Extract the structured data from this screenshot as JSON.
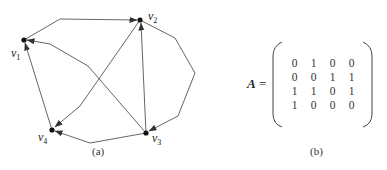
{
  "figure_a": {
    "caption": "(a)",
    "vertices": [
      {
        "id": "v1",
        "label": "v",
        "sub": "1",
        "x": 24,
        "y": 40
      },
      {
        "id": "v2",
        "label": "v",
        "sub": "2",
        "x": 140,
        "y": 20
      },
      {
        "id": "v3",
        "label": "v",
        "sub": "3",
        "x": 146,
        "y": 133
      },
      {
        "id": "v4",
        "label": "v",
        "sub": "4",
        "x": 52,
        "y": 130
      }
    ],
    "edges": [
      {
        "from": "v1",
        "to": "v2"
      },
      {
        "from": "v2",
        "to": "v3"
      },
      {
        "from": "v2",
        "to": "v4"
      },
      {
        "from": "v3",
        "to": "v1"
      },
      {
        "from": "v3",
        "to": "v2"
      },
      {
        "from": "v3",
        "to": "v4"
      },
      {
        "from": "v4",
        "to": "v1"
      }
    ]
  },
  "figure_b": {
    "caption": "(b)",
    "matrix_name": "A",
    "equals": "=",
    "rows": [
      [
        "0",
        "1",
        "0",
        "0"
      ],
      [
        "0",
        "0",
        "1",
        "1"
      ],
      [
        "1",
        "1",
        "0",
        "1"
      ],
      [
        "1",
        "0",
        "0",
        "0"
      ]
    ]
  }
}
